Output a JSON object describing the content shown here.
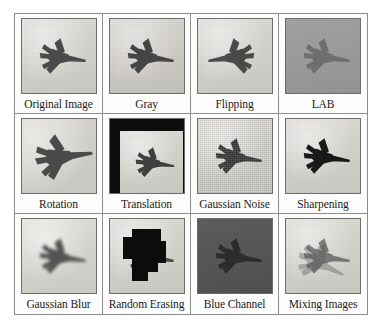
{
  "figure": {
    "name": "data-augmentation-grid",
    "rows": 3,
    "columns": 4,
    "border_color": "#8e8e8e",
    "background": "#ffffff"
  },
  "cells": [
    {
      "id": "original-image",
      "label": "Original Image",
      "background": "#d6d4ce",
      "jet_fill": "#4a4a4a",
      "effect": "none"
    },
    {
      "id": "gray",
      "label": "Gray",
      "background": "#d2d0cb",
      "jet_fill": "#454545",
      "effect": "grayscale"
    },
    {
      "id": "flipping",
      "label": "Flipping",
      "background": "#d6d4ce",
      "jet_fill": "#4a4a4a",
      "effect": "horizontal-flip"
    },
    {
      "id": "lab",
      "label": "LAB",
      "background": "#9a9a9a",
      "jet_fill": "#6e6e6e",
      "effect": "lab-colorspace"
    },
    {
      "id": "rotation",
      "label": "Rotation",
      "background": "#d8d6d0",
      "jet_fill": "#4a4a4a",
      "effect": "rotate",
      "rotation_deg": -15,
      "fill_color": "#0b0b0b"
    },
    {
      "id": "translation",
      "label": "Translation",
      "background": "#d8d6d0",
      "jet_fill": "#3f3f3f",
      "effect": "translate",
      "fill_color": "#0c0c0c"
    },
    {
      "id": "gaussian-noise",
      "label": "Gaussian Noise",
      "background": "#d4d2cc",
      "jet_fill": "#434343",
      "effect": "gaussian-noise"
    },
    {
      "id": "sharpening",
      "label": "Sharpening",
      "background": "#cfcdc7",
      "jet_fill": "#393939",
      "effect": "sharpen"
    },
    {
      "id": "gaussian-blur",
      "label": "Gaussian Blur",
      "background": "#d6d4ce",
      "jet_fill": "#545454",
      "effect": "blur"
    },
    {
      "id": "random-erasing",
      "label": "Random Erasing",
      "background": "#d8d6d0",
      "jet_fill": "#4a4a4a",
      "effect": "random-erasing",
      "fill_color": "#0c0c0c"
    },
    {
      "id": "blue-channel",
      "label": "Blue Channel",
      "background": "#545454",
      "jet_fill": "#2c2c2c",
      "effect": "blue-channel"
    },
    {
      "id": "mixing-images",
      "label": "Mixing Images",
      "background": "#cfcdc7",
      "jet_fill": "#5a5a5a",
      "effect": "mixup"
    }
  ]
}
